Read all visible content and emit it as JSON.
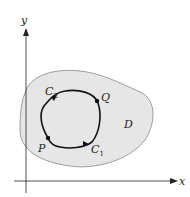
{
  "diagram": {
    "axes": {
      "x_label": "x",
      "y_label": "y"
    },
    "region": {
      "label": "D",
      "fill": "#e6e6e6",
      "stroke": "#888888"
    },
    "curve": {
      "stroke": "#111111"
    },
    "points": {
      "P": "P",
      "Q": "Q"
    },
    "paths": {
      "C1": {
        "base": "C",
        "sub": "1"
      },
      "C2": {
        "base": "C",
        "sub": "2"
      }
    }
  }
}
